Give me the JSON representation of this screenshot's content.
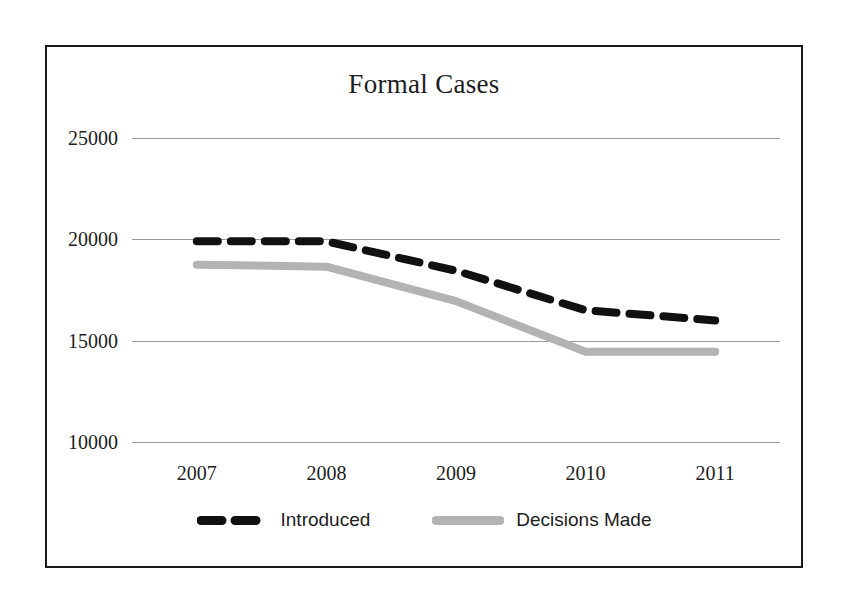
{
  "chart_data": {
    "type": "line",
    "title": "Formal Cases",
    "xlabel": "",
    "ylabel": "",
    "categories": [
      "2007",
      "2008",
      "2009",
      "2010",
      "2011"
    ],
    "x": [
      2007,
      2008,
      2009,
      2010,
      2011
    ],
    "ylim": [
      10000,
      25000
    ],
    "yticks": [
      25000,
      20000,
      15000,
      10000
    ],
    "ytick_labels": [
      "25000",
      "20000",
      "15000",
      "10000"
    ],
    "grid": true,
    "legend_position": "bottom",
    "series": [
      {
        "name": "Introduced",
        "values": [
          19900,
          19900,
          18450,
          16500,
          16000
        ],
        "color": "#111111",
        "style": "dashed",
        "width": 8
      },
      {
        "name": "Decisions Made",
        "values": [
          18750,
          18650,
          16950,
          14450,
          14450
        ],
        "color": "#b3b3b3",
        "style": "solid",
        "width": 8
      }
    ]
  },
  "chart": {
    "title": "Formal Cases",
    "y_axis": {
      "ticks": [
        "25000",
        "20000",
        "15000",
        "10000"
      ]
    },
    "x_axis": {
      "ticks": [
        "2007",
        "2008",
        "2009",
        "2010",
        "2011"
      ]
    },
    "legend": {
      "items": [
        {
          "label": "Introduced",
          "color": "#111111",
          "swatch": "dashed-line-swatch"
        },
        {
          "label": "Decisions Made",
          "color": "#b3b3b3",
          "swatch": "solid-line-swatch"
        }
      ]
    },
    "colors": {
      "border": "#1a1a1a",
      "gridline": "#9c9c9c",
      "introduced": "#111111",
      "decisions_made": "#b3b3b3",
      "background": "#ffffff",
      "text": "#1d1d1d"
    }
  }
}
